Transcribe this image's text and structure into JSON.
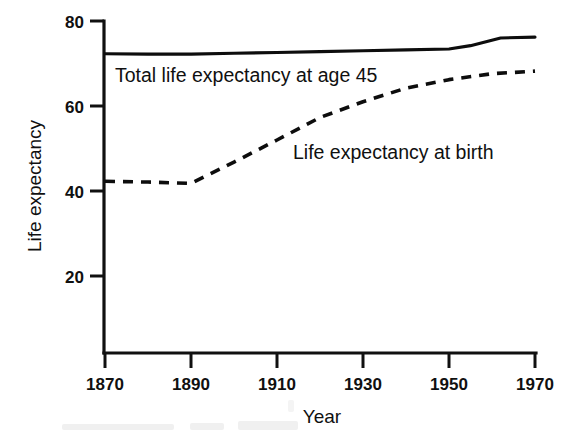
{
  "chart_data": {
    "type": "line",
    "title": "",
    "xlabel": "Year",
    "ylabel": "Life expectancy",
    "xlim": [
      1870,
      1970
    ],
    "ylim": [
      0,
      80
    ],
    "grid": false,
    "legend_position": "inline-annotations",
    "xticks": [
      1870,
      1890,
      1910,
      1930,
      1950,
      1970
    ],
    "xtick_labels": [
      "1870",
      "1890",
      "1910",
      "1930",
      "1950",
      "1970"
    ],
    "yticks": [
      20,
      40,
      60,
      80
    ],
    "ytick_labels": [
      "20",
      "40",
      "60",
      "80"
    ],
    "series": [
      {
        "name": "Total life expectancy at age 45",
        "style": "solid",
        "label_text": "Total life expectancy at age 45",
        "x": [
          1870,
          1880,
          1890,
          1900,
          1910,
          1920,
          1930,
          1940,
          1950,
          1955,
          1962,
          1970
        ],
        "values": [
          72.3,
          72.2,
          72.2,
          72.4,
          72.6,
          72.8,
          73.0,
          73.2,
          73.4,
          74.2,
          76.0,
          76.2
        ]
      },
      {
        "name": "Life expectancy at birth",
        "style": "dashed",
        "label_text": "Life expectancy at birth",
        "x": [
          1870,
          1880,
          1890,
          1900,
          1910,
          1920,
          1930,
          1940,
          1950,
          1960,
          1970
        ],
        "values": [
          42.3,
          42.1,
          41.8,
          46.8,
          52.0,
          57.3,
          61.0,
          64.2,
          66.2,
          67.6,
          68.2
        ]
      }
    ],
    "annotations": [
      {
        "text": "Total life expectancy at age 45",
        "x": 1872,
        "y": 70.0
      },
      {
        "text": "Life expectancy at birth",
        "x": 1914,
        "y": 51.5
      }
    ]
  }
}
